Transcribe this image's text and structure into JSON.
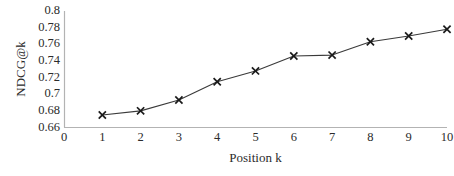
{
  "chart_data": {
    "type": "line",
    "title": "",
    "xlabel": "Position k",
    "ylabel": "NDCG@k",
    "x": [
      1,
      2,
      3,
      4,
      5,
      6,
      7,
      8,
      9,
      10
    ],
    "values": [
      0.675,
      0.68,
      0.693,
      0.715,
      0.728,
      0.746,
      0.747,
      0.763,
      0.77,
      0.778
    ],
    "series": [
      {
        "name": "NDCG@k",
        "values": [
          0.675,
          0.68,
          0.693,
          0.715,
          0.728,
          0.746,
          0.747,
          0.763,
          0.77,
          0.778
        ]
      }
    ],
    "xlim": [
      0,
      10
    ],
    "ylim": [
      0.66,
      0.8
    ],
    "x_ticks": [
      "0",
      "1",
      "2",
      "3",
      "4",
      "5",
      "6",
      "7",
      "8",
      "9",
      "10"
    ],
    "x_tick_values": [
      0,
      1,
      2,
      3,
      4,
      5,
      6,
      7,
      8,
      9,
      10
    ],
    "y_ticks": [
      "0.66",
      "0.68",
      "0.7",
      "0.72",
      "0.74",
      "0.76",
      "0.78",
      "0.8"
    ],
    "y_tick_values": [
      0.66,
      0.68,
      0.7,
      0.72,
      0.74,
      0.76,
      0.78,
      0.8
    ],
    "grid": false,
    "legend": false,
    "legend_position": "none",
    "marker": "x-cross",
    "line_color": "#3a3a3a",
    "marker_color": "#1a1a1a",
    "axis_color": "#b3b3b3"
  }
}
